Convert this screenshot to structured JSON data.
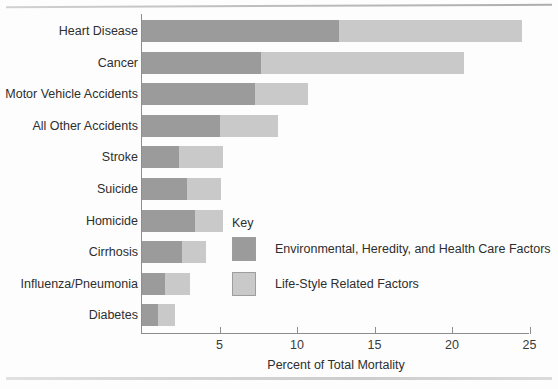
{
  "chart_data": {
    "type": "bar",
    "orientation": "horizontal",
    "stacked": true,
    "title": "",
    "xlabel": "Percent of Total Mortality",
    "ylabel": "",
    "xlim": [
      0,
      25
    ],
    "xticks": [
      5,
      10,
      15,
      20,
      25
    ],
    "xtick_labels": [
      "5",
      "10",
      "15",
      "20",
      "25"
    ],
    "grid": false,
    "legend_position": "inside-center-right",
    "categories": [
      "Heart Disease",
      "Cancer",
      "Motor Vehicle Accidents",
      "All Other Accidents",
      "Stroke",
      "Suicide",
      "Homicide",
      "Cirrhosis",
      "Influenza/Pneumonia",
      "Diabetes"
    ],
    "series": [
      {
        "name": "Environmental, Heredity, and Health Care Factors",
        "color": "#9b9b9b",
        "values": [
          12.7,
          7.7,
          7.3,
          5.0,
          2.4,
          2.9,
          3.4,
          2.6,
          1.5,
          1.0
        ]
      },
      {
        "name": "Life-Style Related Factors",
        "color": "#c9c9c9",
        "values": [
          11.8,
          13.1,
          3.4,
          3.8,
          2.8,
          2.2,
          1.8,
          1.5,
          1.6,
          1.1
        ]
      }
    ],
    "totals": [
      24.5,
      20.8,
      10.7,
      8.8,
      5.2,
      5.1,
      5.2,
      4.1,
      3.1,
      2.1
    ]
  },
  "legend": {
    "title": "Key",
    "entries": [
      {
        "label": "Environmental, Heredity, and Health Care Factors",
        "color": "#9b9b9b"
      },
      {
        "label": "Life-Style Related Factors",
        "color": "#c9c9c9"
      }
    ]
  },
  "colors": {
    "dark_segment": "#9b9b9b",
    "light_segment": "#c9c9c9",
    "axis": "#8e8e8e",
    "text": "#2e2e2e",
    "background": "#fdfdfd"
  }
}
